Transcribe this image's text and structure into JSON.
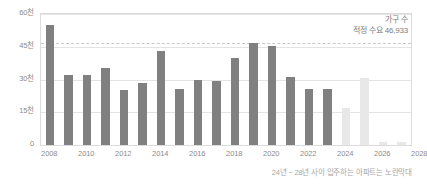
{
  "chart_data": {
    "type": "bar",
    "title": "",
    "subtitle": "",
    "xlabel": "",
    "ylabel": "",
    "ylim": [
      0,
      60000
    ],
    "grid": true,
    "legend_position": "none",
    "categories": [
      "2008",
      "2009",
      "2010",
      "2011",
      "2012",
      "2013",
      "2014",
      "2015",
      "2016",
      "2017",
      "2018",
      "2019",
      "2020",
      "2021",
      "2022",
      "2023",
      "2024",
      "2025",
      "2026",
      "2027"
    ],
    "series": [
      {
        "name": "가구 수",
        "values": [
          55000,
          32000,
          32000,
          35500,
          25000,
          28500,
          43000,
          25500,
          30000,
          29500,
          40000,
          46500,
          45500,
          31000,
          25500,
          25500,
          17000,
          30500,
          1200,
          1500
        ],
        "point_colors": [
          "#808080",
          "#808080",
          "#808080",
          "#808080",
          "#808080",
          "#808080",
          "#808080",
          "#808080",
          "#808080",
          "#808080",
          "#808080",
          "#808080",
          "#808080",
          "#808080",
          "#808080",
          "#808080",
          "#e8e8e8",
          "#e8e8e8",
          "#e8e8e8",
          "#e8e8e8"
        ]
      }
    ],
    "y_ticks": [
      {
        "value": 0,
        "label": "0"
      },
      {
        "value": 15000,
        "label": "15천"
      },
      {
        "value": 30000,
        "label": "30천"
      },
      {
        "value": 45000,
        "label": "45천"
      },
      {
        "value": 60000,
        "label": "60천"
      }
    ],
    "x_ticks": [
      "2008",
      "2010",
      "2012",
      "2014",
      "2016",
      "2018",
      "2020",
      "2022",
      "2024",
      "2026",
      "2028"
    ],
    "reference_line": {
      "value": 46933,
      "label": "적정 수요 46,933",
      "style": "dashed",
      "color": "#c9c9c9"
    },
    "annotation": {
      "line1": "가구 수",
      "line2": "적정 수요 46,933"
    },
    "caption": "24년 ~ 28년 사이 입주하는 아파트는 노란막대",
    "colors": {
      "bar_past": "#808080",
      "bar_future": "#e8e8e8",
      "gridline": "#e3e3e3",
      "frame": "#dcdcdc",
      "text": "#8c8c8c",
      "caption_text": "#a6a6a6"
    }
  }
}
